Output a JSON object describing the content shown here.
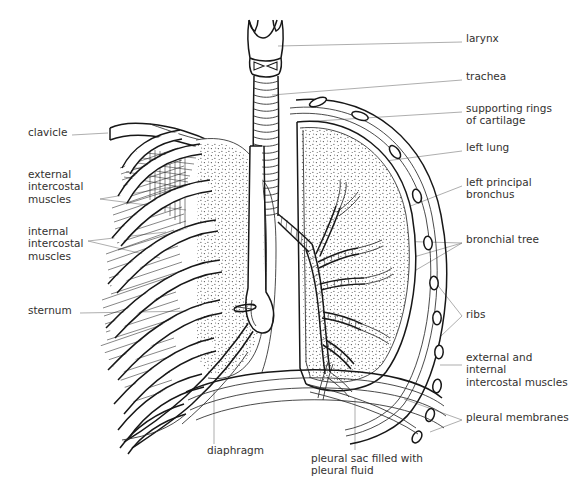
{
  "figure": {
    "style": "black-and-white line drawing with stippling and hatching",
    "background": "#ffffff",
    "ink_color": "#1a1a1a",
    "label_color": "#33312f",
    "leader_color": "#8b8b8b"
  },
  "labels_right": [
    {
      "id": "larynx",
      "text": "larynx",
      "x": 466,
      "y": 38
    },
    {
      "id": "trachea",
      "text": "trachea",
      "x": 466,
      "y": 76
    },
    {
      "id": "supporting-rings-of-cartilage",
      "text": "supporting rings\nof cartilage",
      "x": 466,
      "y": 108
    },
    {
      "id": "left-lung",
      "text": "left lung",
      "x": 466,
      "y": 147
    },
    {
      "id": "left-principal-bronchus",
      "text": "left principal\nbronchus",
      "x": 466,
      "y": 182
    },
    {
      "id": "bronchial-tree",
      "text": "bronchial tree",
      "x": 466,
      "y": 239
    },
    {
      "id": "ribs",
      "text": "ribs",
      "x": 466,
      "y": 313
    },
    {
      "id": "external-and-internal-intercostal-muscles",
      "text": "external and\ninternal\nintercostal muscles",
      "x": 466,
      "y": 358
    },
    {
      "id": "pleural-membranes",
      "text": "pleural membranes",
      "x": 466,
      "y": 417
    }
  ],
  "labels_left": [
    {
      "id": "clavicle",
      "text": "clavicle",
      "x": 28,
      "y": 131
    },
    {
      "id": "external-intercostal-muscles",
      "text": "external\nintercostal\nmuscles",
      "x": 28,
      "y": 174
    },
    {
      "id": "internal-intercostal-muscles",
      "text": "internal\nintercostal\nmuscles",
      "x": 28,
      "y": 231
    },
    {
      "id": "sternum",
      "text": "sternum",
      "x": 28,
      "y": 309
    }
  ],
  "labels_bottom": [
    {
      "id": "diaphragm",
      "text": "diaphragm",
      "x": 207,
      "y": 449
    },
    {
      "id": "pleural-sac",
      "text": "pleural sac filled with\npleural fluid",
      "x": 311,
      "y": 457
    }
  ],
  "anatomy_parts": [
    "larynx",
    "trachea",
    "supporting rings of cartilage",
    "left lung",
    "left principal bronchus",
    "bronchial tree",
    "ribs",
    "external intercostal muscles",
    "internal intercostal muscles",
    "pleural membranes",
    "clavicle",
    "sternum",
    "diaphragm",
    "pleural sac filled with pleural fluid"
  ]
}
